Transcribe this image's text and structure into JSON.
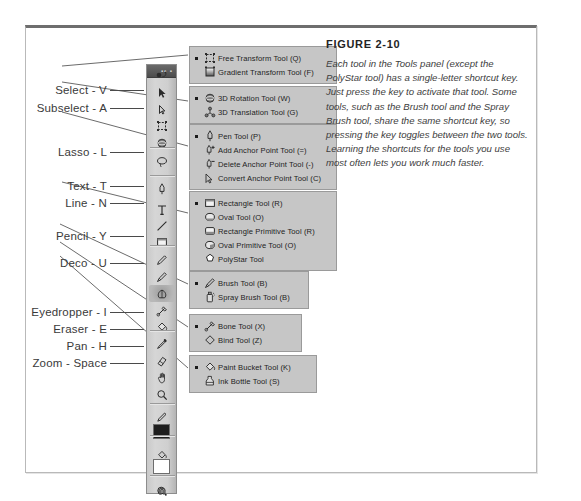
{
  "figure": {
    "title": "FIGURE 2-10",
    "caption": "Each tool in the Tools panel (except the PolyStar tool) has a single-letter shortcut key. Just press the key to activate that tool. Some tools, such as the Brush tool and the Spray Brush tool, share the same shortcut key, so pressing the key toggles between the two tools. Learning the shortcuts for the tools you use most often lets you work much faster."
  },
  "callouts": [
    {
      "label": "Select - V",
      "top": 62,
      "rule_left": 84,
      "rule_width": 34
    },
    {
      "label": "Subselect - A",
      "top": 80,
      "rule_left": 84,
      "rule_width": 34
    },
    {
      "label": "Lasso - L",
      "top": 124,
      "rule_left": 84,
      "rule_width": 34
    },
    {
      "label": "Text - T",
      "top": 158,
      "rule_left": 84,
      "rule_width": 34
    },
    {
      "label": "Line - N",
      "top": 175,
      "rule_left": 84,
      "rule_width": 34
    },
    {
      "label": "Pencil - Y",
      "top": 208,
      "rule_left": 84,
      "rule_width": 34
    },
    {
      "label": "Deco - U",
      "top": 235,
      "rule_left": 84,
      "rule_width": 34
    },
    {
      "label": "Eyedropper - I",
      "top": 284,
      "rule_left": 84,
      "rule_width": 34
    },
    {
      "label": "Eraser - E",
      "top": 301,
      "rule_left": 84,
      "rule_width": 34
    },
    {
      "label": "Pan - H",
      "top": 318,
      "rule_left": 84,
      "rule_width": 34
    },
    {
      "label": "Zoom - Space",
      "top": 335,
      "rule_left": 84,
      "rule_width": 34
    }
  ],
  "tools_panel": {
    "name": "Tools panel",
    "header_dots": "▪▪ ▪",
    "tools": [
      {
        "name": "selection-tool",
        "icon": "arrow"
      },
      {
        "name": "subselection-tool",
        "icon": "arrow-hollow"
      },
      {
        "name": "free-transform-tool",
        "icon": "free-transform"
      },
      {
        "name": "3d-rotation-tool",
        "icon": "sphere"
      },
      {
        "name": "lasso-tool",
        "icon": "lasso"
      },
      {
        "name": "pen-tool",
        "icon": "pen"
      },
      {
        "name": "text-tool",
        "icon": "text-t"
      },
      {
        "name": "line-tool",
        "icon": "line"
      },
      {
        "name": "rectangle-tool",
        "icon": "rectangle"
      },
      {
        "name": "pencil-tool",
        "icon": "pencil"
      },
      {
        "name": "brush-tool",
        "icon": "brush"
      },
      {
        "name": "deco-tool",
        "icon": "deco"
      },
      {
        "name": "bone-tool",
        "icon": "bone"
      },
      {
        "name": "paint-bucket-tool",
        "icon": "paint-bucket"
      },
      {
        "name": "eyedropper-tool",
        "icon": "eyedropper"
      },
      {
        "name": "eraser-tool",
        "icon": "eraser"
      },
      {
        "name": "hand-tool",
        "icon": "hand"
      },
      {
        "name": "zoom-tool",
        "icon": "magnifier"
      },
      {
        "name": "stroke-color-tool",
        "icon": "pencil-stroke"
      },
      {
        "name": "fill-color-swatch-black",
        "icon": "swatch-black"
      },
      {
        "name": "fill-color-tool",
        "icon": "fill-bucket"
      },
      {
        "name": "fill-color-swatch-white",
        "icon": "swatch-white"
      },
      {
        "name": "black-and-white-swap",
        "icon": "bw-swap"
      },
      {
        "name": "object-drawing-option",
        "icon": "circle-option"
      },
      {
        "name": "snap-to-objects-option",
        "icon": "magnet-option"
      }
    ]
  },
  "flyouts": [
    {
      "name": "transform-flyout",
      "left": 163,
      "top": 18,
      "width": 148,
      "items": [
        {
          "icon": "free-transform",
          "label": "Free Transform Tool (Q)",
          "selected": true
        },
        {
          "icon": "gradient-transform",
          "label": "Gradient Transform Tool (F)",
          "selected": false
        }
      ]
    },
    {
      "name": "3d-flyout",
      "left": 163,
      "top": 58,
      "width": 148,
      "items": [
        {
          "icon": "sphere",
          "label": "3D Rotation Tool (W)",
          "selected": true
        },
        {
          "icon": "3d-trans",
          "label": "3D Translation Tool (G)",
          "selected": false
        }
      ]
    },
    {
      "name": "pen-flyout",
      "left": 163,
      "top": 96,
      "width": 148,
      "items": [
        {
          "icon": "pen",
          "label": "Pen Tool (P)",
          "selected": true
        },
        {
          "icon": "pen-plus",
          "label": "Add Anchor Point Tool (=)",
          "selected": false
        },
        {
          "icon": "pen-minus",
          "label": "Delete Anchor Point Tool (-)",
          "selected": false
        },
        {
          "icon": "pen-convert",
          "label": "Convert Anchor Point Tool (C)",
          "selected": false
        }
      ]
    },
    {
      "name": "shape-flyout",
      "left": 163,
      "top": 163,
      "width": 148,
      "items": [
        {
          "icon": "rectangle",
          "label": "Rectangle Tool (R)",
          "selected": true
        },
        {
          "icon": "oval",
          "label": "Oval Tool (O)",
          "selected": false
        },
        {
          "icon": "rect-primitive",
          "label": "Rectangle Primitive Tool (R)",
          "selected": false
        },
        {
          "icon": "oval-primitive",
          "label": "Oval Primitive Tool (O)",
          "selected": false
        },
        {
          "icon": "polystar",
          "label": "PolyStar Tool",
          "selected": false
        }
      ]
    },
    {
      "name": "brush-flyout",
      "left": 163,
      "top": 243,
      "width": 120,
      "items": [
        {
          "icon": "brush",
          "label": "Brush Tool (B)",
          "selected": true
        },
        {
          "icon": "spray-brush",
          "label": "Spray Brush Tool (B)",
          "selected": false
        }
      ]
    },
    {
      "name": "bone-flyout",
      "left": 163,
      "top": 286,
      "width": 113,
      "items": [
        {
          "icon": "bone",
          "label": "Bone Tool (X)",
          "selected": true
        },
        {
          "icon": "bind",
          "label": "Bind Tool (Z)",
          "selected": false
        }
      ]
    },
    {
      "name": "paint-bucket-flyout",
      "left": 163,
      "top": 327,
      "width": 128,
      "items": [
        {
          "icon": "paint-bucket",
          "label": "Paint Bucket Tool (K)",
          "selected": true
        },
        {
          "icon": "ink-bottle",
          "label": "Ink Bottle Tool (S)",
          "selected": false
        }
      ]
    }
  ],
  "colors": {
    "frame_border": "#b9b9b9",
    "frame_top_rule": "#6e6e6e",
    "panel_bg": "#cfcfcf",
    "flyout_bg": "#c6c6c6",
    "flyout_border": "#9a9a9a",
    "text": "#1d1d1d",
    "label_text": "#3a3a3a",
    "caption_text": "#3d3d3d"
  }
}
